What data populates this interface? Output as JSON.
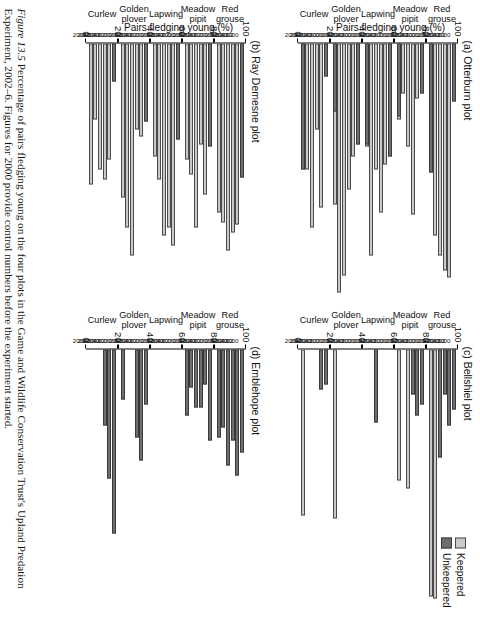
{
  "figure": {
    "number": "Figure 13.5",
    "caption_line1": "Percentage of pairs fledging young on the four plots in the Game and Wildlife Conservation Trust's Upland",
    "caption_line2": "Predation Experiment, 2002–6. Figures for 2000 provide control numbers before the experiment started."
  },
  "legend": {
    "position": "top-right",
    "entries": [
      {
        "label": "Keepered",
        "color": "#c9c9c9"
      },
      {
        "label": "Unkeepered",
        "color": "#6e6e6e"
      }
    ]
  },
  "axis": {
    "ylabel": "Pairs fledging young (%)",
    "yticks": [
      "0",
      "20",
      "40",
      "60",
      "80",
      "100"
    ],
    "ymin": 0,
    "ymax": 100
  },
  "species": [
    "Curlew",
    "Golden\nplover",
    "Lapwing",
    "Meadow\npipit",
    "Red\ngrouse"
  ],
  "years": [
    "2000",
    "2002",
    "2003",
    "2004",
    "2005",
    "2006"
  ],
  "chart_data": [
    {
      "type": "bar",
      "panel": "a",
      "title": "(a) Otterburn plot",
      "categories": [
        "Curlew",
        "Golden plover",
        "Lapwing",
        "Meadow pipit",
        "Red grouse"
      ],
      "x": [
        "2000",
        "2002",
        "2003",
        "2004",
        "2005",
        "2006"
      ],
      "ylabel": "Pairs fledging young (%)",
      "xlabel": "",
      "ylim": [
        0,
        100
      ],
      "grid": false,
      "series": [
        {
          "name": "Keepered",
          "color": "#c9c9c9",
          "values": {
            "Curlew": [
              0,
              65,
              34,
              73,
              50,
              0
            ],
            "Golden plover": [
              0,
              45,
              58,
              92,
              99,
              64
            ],
            "Lapwing": [
              0,
              48,
              67,
              50,
              84,
              41
            ],
            "Meadow pipit": [
              0,
              22,
              68,
              41,
              20,
              30
            ],
            "Red grouse": [
              0,
              93,
              90,
              84,
              76,
              49
            ]
          }
        },
        {
          "name": "Unkeepered",
          "color": "#6e6e6e",
          "values": {
            "Curlew": [
              13,
              0,
              0,
              0,
              0,
              50
            ],
            "Golden plover": [
              40,
              0,
              0,
              0,
              0,
              27
            ],
            "Lapwing": [
              45,
              0,
              0,
              0,
              0,
              40
            ],
            "Meadow pipit": [
              20,
              0,
              0,
              0,
              0,
              29
            ],
            "Red grouse": [
              23,
              0,
              0,
              0,
              0,
              51
            ]
          }
        }
      ]
    },
    {
      "type": "bar",
      "panel": "b",
      "title": "(b) Ray Demesne plot",
      "categories": [
        "Curlew",
        "Golden plover",
        "Lapwing",
        "Meadow pipit",
        "Red grouse"
      ],
      "x": [
        "2000",
        "2002",
        "2003",
        "2004",
        "2005",
        "2006"
      ],
      "ylabel": "Pairs fledging young (%)",
      "xlabel": "",
      "ylim": [
        0,
        100
      ],
      "grid": false,
      "series": [
        {
          "name": "Keepered",
          "color": "#c9c9c9",
          "values": {
            "Curlew": [
              0,
              46,
              54,
              50,
              30,
              56
            ],
            "Golden plover": [
              0,
              37,
              34,
              84,
              73,
              61
            ],
            "Lapwing": [
              0,
              80,
              73,
              76,
              54,
              45
            ],
            "Meadow pipit": [
              0,
              60,
              40,
              73,
              52,
              46
            ],
            "Red grouse": [
              0,
              72,
              75,
              82,
              71,
              67
            ]
          }
        },
        {
          "name": "Unkeepered",
          "color": "#6e6e6e",
          "values": {
            "Curlew": [
              15,
              0,
              0,
              0,
              0,
              0
            ],
            "Golden plover": [
              31,
              0,
              0,
              0,
              0,
              0
            ],
            "Lapwing": [
              38,
              0,
              0,
              0,
              0,
              0
            ],
            "Meadow pipit": [
              41,
              0,
              0,
              0,
              0,
              0
            ],
            "Red grouse": [
              53,
              0,
              0,
              0,
              0,
              0
            ]
          }
        }
      ]
    },
    {
      "type": "bar",
      "panel": "c",
      "title": "(c) Bellshiel plot",
      "categories": [
        "Curlew",
        "Golden plover",
        "Lapwing",
        "Meadow pipit",
        "Red grouse"
      ],
      "x": [
        "2000",
        "2002",
        "2003",
        "2004",
        "2005",
        "2006"
      ],
      "ylabel": "",
      "xlabel": "",
      "ylim": [
        0,
        100
      ],
      "grid": false,
      "series": [
        {
          "name": "Keepered",
          "color": "#c9c9c9",
          "values": {
            "Curlew": [
              0,
              0,
              0,
              0,
              0,
              66
            ],
            "Golden plover": [
              0,
              0,
              0,
              0,
              0,
              67
            ],
            "Lapwing": [
              0,
              0,
              0,
              0,
              0,
              0
            ],
            "Meadow pipit": [
              0,
              0,
              0,
              55,
              0,
              52
            ],
            "Red grouse": [
              0,
              0,
              0,
              0,
              99,
              98
            ]
          }
        },
        {
          "name": "Unkeepered",
          "color": "#6e6e6e",
          "values": {
            "Curlew": [
              14,
              16,
              0,
              0,
              0,
              0
            ],
            "Golden plover": [
              0,
              0,
              0,
              0,
              0,
              0
            ],
            "Lapwing": [
              0,
              0,
              0,
              29,
              0,
              0
            ],
            "Meadow pipit": [
              22,
              26,
              18,
              0,
              0,
              0
            ],
            "Red grouse": [
              24,
              30,
              18,
              43,
              0,
              0
            ]
          }
        }
      ]
    },
    {
      "type": "bar",
      "panel": "d",
      "title": "(d) Emblehope plot",
      "categories": [
        "Curlew",
        "Golden plover",
        "Lapwing",
        "Meadow pipit",
        "Red grouse"
      ],
      "x": [
        "2000",
        "2002",
        "2003",
        "2004",
        "2005",
        "2006"
      ],
      "ylabel": "",
      "xlabel": "",
      "ylim": [
        0,
        100
      ],
      "grid": false,
      "series": [
        {
          "name": "Keepered",
          "color": "#c9c9c9",
          "values": {
            "Curlew": [
              0,
              0,
              0,
              0,
              0,
              0
            ],
            "Golden plover": [
              0,
              0,
              0,
              0,
              0,
              0
            ],
            "Lapwing": [
              0,
              0,
              0,
              0,
              0,
              0
            ],
            "Meadow pipit": [
              0,
              0,
              0,
              0,
              0,
              0
            ],
            "Red grouse": [
              0,
              0,
              0,
              0,
              0,
              0
            ]
          }
        },
        {
          "name": "Unkeepered",
          "color": "#6e6e6e",
          "values": {
            "Curlew": [
              73,
              51,
              30,
              0,
              0,
              0
            ],
            "Golden plover": [
              22,
              44,
              35,
              0,
              0,
              20
            ],
            "Lapwing": [
              0,
              0,
              0,
              0,
              0,
              0
            ],
            "Meadow pipit": [
              36,
              14,
              23,
              23,
              15,
              26
            ],
            "Red grouse": [
              41,
              50,
              36,
              46,
              31,
              35
            ]
          }
        }
      ]
    }
  ]
}
